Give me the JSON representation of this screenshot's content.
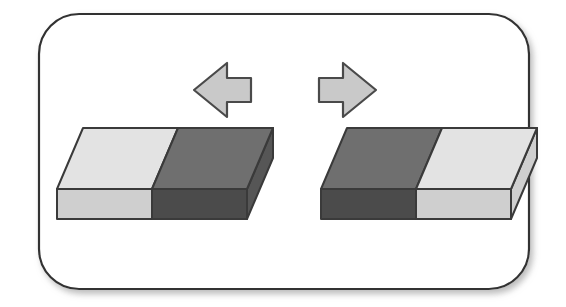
{
  "figure": {
    "canvas": {
      "width": 566,
      "height": 307,
      "background": "#ffffff"
    },
    "frame": {
      "name": "rounded-panel-border",
      "x": 39,
      "y": 14,
      "width": 490,
      "height": 275,
      "corner_radius": 40,
      "stroke_color": "#333333",
      "stroke_width": 2.2,
      "fill_color": "#ffffff",
      "shadow": {
        "color": "#b8b8b8",
        "offset_x": 3,
        "offset_y": 4,
        "blur": 4
      }
    },
    "arrows": [
      {
        "name": "left-arrow",
        "direction": "left",
        "label": "points left",
        "fill_color": "#c9c9c9",
        "stroke_color": "#4a4a4a",
        "stroke_width": 2.2,
        "tip_x": 194,
        "tail_x": 251,
        "center_y": 90,
        "head_half_height": 27,
        "shaft_half_height": 12
      },
      {
        "name": "right-arrow",
        "direction": "right",
        "label": "points right",
        "fill_color": "#c9c9c9",
        "stroke_color": "#4a4a4a",
        "stroke_width": 2.2,
        "tip_x": 376,
        "tail_x": 319,
        "center_y": 90,
        "head_half_height": 27,
        "shaft_half_height": 12
      }
    ],
    "blocks": [
      {
        "name": "left-block",
        "position": "left",
        "halves": [
          "light",
          "dark"
        ],
        "geometry": {
          "front_left_x": 57,
          "front_right_x": 247,
          "front_top_y": 189,
          "front_bottom_y": 219,
          "back_offset_x": 26,
          "back_offset_y": -61,
          "split_fraction": 0.5
        },
        "colors": {
          "top_light": "#e3e3e3",
          "top_dark": "#6f6f6f",
          "front_light": "#cfcfcf",
          "front_dark": "#4b4b4b",
          "side_dark": "#565656",
          "outline": "#3a3a3a"
        }
      },
      {
        "name": "right-block",
        "position": "right",
        "halves": [
          "dark",
          "light"
        ],
        "geometry": {
          "front_left_x": 321,
          "front_right_x": 511,
          "front_top_y": 189,
          "front_bottom_y": 219,
          "back_offset_x": 26,
          "back_offset_y": -61,
          "split_fraction": 0.5
        },
        "colors": {
          "top_light": "#e3e3e3",
          "top_dark": "#6f6f6f",
          "front_light": "#cfcfcf",
          "front_dark": "#4b4b4b",
          "side_dark": "#565656",
          "outline": "#3a3a3a"
        }
      }
    ]
  }
}
